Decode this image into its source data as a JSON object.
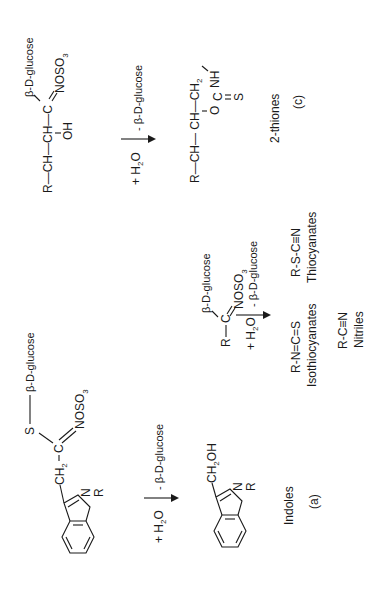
{
  "figure": {
    "orientation": "rotated-90-ccw",
    "panels": {
      "a": {
        "label": "(a)",
        "class_name": "Indoles",
        "substrate": {
          "glucose": "β-D-glucose",
          "s": "S",
          "c": "C",
          "ch2": "CH",
          "ch2_sub": "2",
          "noso3": "NOSO",
          "noso3_sub": "3",
          "n": "N",
          "r": "R"
        },
        "reaction": {
          "reagent": "+ H",
          "reagent_sub": "2",
          "reagent_tail": "O",
          "loss": "- β-D-glucose"
        },
        "product": {
          "ch2oh": "CH",
          "ch2oh_sub": "2",
          "ch2oh_tail": "OH",
          "n": "N",
          "r": "R"
        }
      },
      "b": {
        "substrate": {
          "r": "R",
          "c": "C",
          "glucose": "β-D-glucose",
          "noso3": "NOSO",
          "noso3_sub": "3"
        },
        "reaction": {
          "reagent": "+ H",
          "reagent_sub": "2",
          "reagent_tail": "O",
          "loss": "- β-D-glucose"
        },
        "products": [
          {
            "formula": "R-N=C=S",
            "name": "Isothiocyanates"
          },
          {
            "formula": "R-S-C≡N",
            "name": "Thiocyanates"
          },
          {
            "formula": "R-C≡N",
            "name": "Nitriles"
          }
        ]
      },
      "c": {
        "label": "(c)",
        "class_name": "2-thiones",
        "substrate": {
          "chain": "R—CH—CH—C",
          "oh": "OH",
          "glucose": "β-D-glucose",
          "noso3": "NOSO",
          "noso3_sub": "3"
        },
        "reaction": {
          "reagent": "+ H",
          "reagent_sub": "2",
          "reagent_tail": "O",
          "loss": "- β-D-glucose"
        },
        "product": {
          "chain": "R—CH— CH—CH",
          "chain_sub": "2",
          "o": "O",
          "c": "C",
          "nh": "NH",
          "s": "S"
        }
      }
    }
  }
}
